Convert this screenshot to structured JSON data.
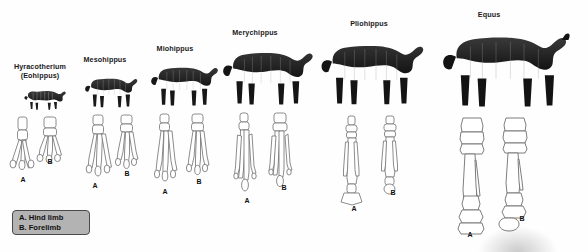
{
  "figure": {
    "title_present": false,
    "background": "#fefefe",
    "bone_outline_color": "#6d6d6d",
    "bone_fill_color": "#ffffff",
    "animal_color": "#2b2b2b",
    "legend_bg": "#b3b3b3",
    "legend_border": "#4a4a4a"
  },
  "legend": {
    "line_a": "A. Hind limb",
    "line_b": "B. Forelimb"
  },
  "limb_labels": {
    "hind": "A",
    "fore": "B"
  },
  "species": [
    {
      "id": "hyracotherium",
      "name": "Hyracotherium\n(Eohippus)",
      "label_x": 14,
      "label_y": 62,
      "animal_x": 22,
      "animal_y": 80,
      "animal_w": 48,
      "animal_h": 32,
      "animal_scale": 0.34,
      "toes_hind": 4,
      "toes_fore": 4,
      "bone_x": 10,
      "bone_y": 117,
      "bone_h": 58,
      "a_x": 20,
      "a_y": 179,
      "b_x": 47,
      "b_y": 160
    },
    {
      "id": "mesohippus",
      "name": "Mesohippus",
      "label_x": 78,
      "label_y": 55,
      "animal_x": 82,
      "animal_y": 68,
      "animal_w": 56,
      "animal_h": 42,
      "animal_scale": 0.44,
      "toes_hind": 3,
      "toes_fore": 3,
      "bone_x": 85,
      "bone_y": 115,
      "bone_h": 66,
      "a_x": 92,
      "a_y": 184,
      "b_x": 124,
      "b_y": 172
    },
    {
      "id": "miohippus",
      "name": "Miohippus",
      "label_x": 150,
      "label_y": 44,
      "animal_x": 148,
      "animal_y": 56,
      "animal_w": 70,
      "animal_h": 54,
      "animal_scale": 0.56,
      "toes_hind": 3,
      "toes_fore": 3,
      "bone_x": 152,
      "bone_y": 114,
      "bone_h": 74,
      "a_x": 162,
      "a_y": 190,
      "b_x": 196,
      "b_y": 180
    },
    {
      "id": "merychippus",
      "name": "Merychippus",
      "label_x": 228,
      "label_y": 28,
      "animal_x": 222,
      "animal_y": 40,
      "animal_w": 92,
      "animal_h": 72,
      "animal_scale": 0.74,
      "toes_hind": 3,
      "toes_fore": 3,
      "bone_x": 232,
      "bone_y": 113,
      "bone_h": 84,
      "a_x": 244,
      "a_y": 199,
      "b_x": 281,
      "b_y": 186
    },
    {
      "id": "pliohippus",
      "name": "Pliohippus",
      "label_x": 345,
      "label_y": 19,
      "animal_x": 320,
      "animal_y": 30,
      "animal_w": 104,
      "animal_h": 84,
      "animal_scale": 0.86,
      "toes_hind": 1,
      "toes_fore": 1,
      "bone_x": 336,
      "bone_y": 116,
      "bone_h": 90,
      "a_x": 351,
      "a_y": 207,
      "b_x": 392,
      "b_y": 191
    },
    {
      "id": "equus",
      "name": "Equus",
      "label_x": 480,
      "label_y": 10,
      "animal_x": 440,
      "animal_y": 20,
      "animal_w": 142,
      "animal_h": 96,
      "animal_scale": 1.0,
      "toes_hind": 1,
      "toes_fore": 1,
      "bone_x": 448,
      "bone_y": 118,
      "bone_h": 112,
      "a_x": 468,
      "a_y": 233,
      "b_x": 520,
      "b_y": 217
    }
  ]
}
